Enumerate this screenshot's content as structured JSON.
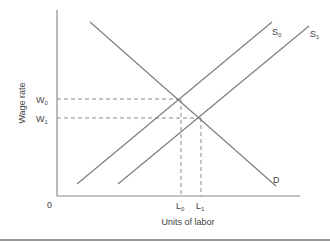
{
  "diagram": {
    "type": "labor market supply-demand shift",
    "y_axis_label": "Wage rate",
    "x_axis_label": "Units of labor",
    "origin_label": "0",
    "wage_levels": [
      {
        "label": "W",
        "sub": "0"
      },
      {
        "label": "W",
        "sub": "1"
      }
    ],
    "labor_levels": [
      {
        "label": "L",
        "sub": "0"
      },
      {
        "label": "L",
        "sub": "1"
      }
    ],
    "curves": [
      {
        "label": "S",
        "sub": "0",
        "kind": "supply (initial)"
      },
      {
        "label": "S",
        "sub": "1",
        "kind": "supply (shifted right)"
      },
      {
        "label": "D",
        "sub": "",
        "kind": "demand"
      }
    ],
    "equilibria": [
      {
        "wage": "W0",
        "labor": "L0",
        "curves": "S0 & D"
      },
      {
        "wage": "W1",
        "labor": "L1",
        "curves": "S1 & D"
      }
    ]
  }
}
